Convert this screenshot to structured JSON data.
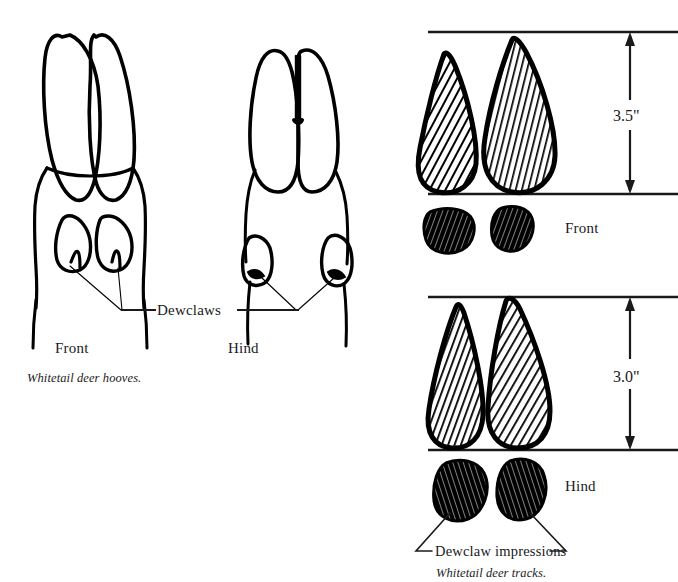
{
  "figure": {
    "ink_color": "#000000",
    "background_color": "#ffffff"
  },
  "hooves_panel": {
    "caption": "Whitetail deer hooves.",
    "front_label": "Front",
    "hind_label": "Hind",
    "dewclaws_label": "Dewclaws"
  },
  "tracks_panel": {
    "caption": "Whitetail deer tracks.",
    "front_label": "Front",
    "hind_label": "Hind",
    "dewclaw_impressions_label": "Dewclaw impressions",
    "front_measurement": "3.5\"",
    "hind_measurement": "3.0\""
  }
}
